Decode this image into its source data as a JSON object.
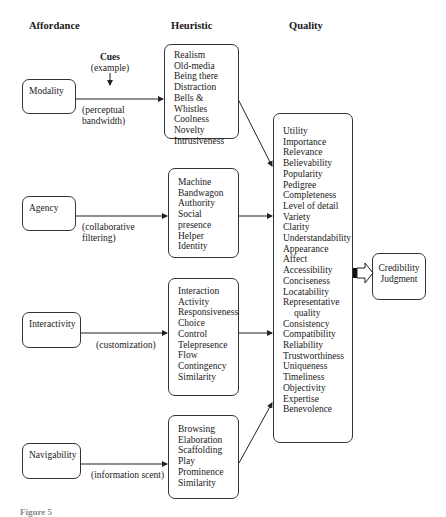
{
  "headers": {
    "affordance": "Affordance",
    "heuristic": "Heuristic",
    "quality": "Quality"
  },
  "cues": {
    "title": "Cues",
    "subtitle": "(example)"
  },
  "rows": [
    {
      "affordance": "Modality",
      "cue": [
        "(perceptual",
        "bandwidth)"
      ],
      "heuristics": [
        "Realism",
        "Old-media",
        "Being there",
        "Distraction",
        "Bells &",
        "Whistles",
        "Coolness",
        "Novelty",
        "Intrusiveness"
      ]
    },
    {
      "affordance": "Agency",
      "cue": [
        "(collaborative",
        "filtering)"
      ],
      "heuristics": [
        "Machine",
        "Bandwagon",
        "Authority",
        "Social",
        "presence",
        "Helper",
        "Identity"
      ]
    },
    {
      "affordance": "Interactivity",
      "cue": [
        "(customization)"
      ],
      "heuristics": [
        "Interaction",
        "Activity",
        "Responsiveness",
        "Choice",
        "Control",
        "Telepresence",
        "Flow",
        "Contingency",
        "Similarity"
      ]
    },
    {
      "affordance": "Navigability",
      "cue": [
        "(information scent)"
      ],
      "heuristics": [
        "Browsing",
        "Elaboration",
        "Scaffolding",
        "Play",
        "Prominence",
        "Similarity"
      ]
    }
  ],
  "quality_items": [
    "Utility",
    "Importance",
    "Relevance",
    "Believability",
    "Popularity",
    "Pedigree",
    "Completeness",
    "Level of detail",
    "Variety",
    "Clarity",
    "Understandability",
    "Appearance",
    "Affect",
    "Accessibility",
    "Conciseness",
    "Locatability",
    "Representative",
    "quality",
    "Consistency",
    "Compatibility",
    "Reliability",
    "Trustworthiness",
    "Uniqueness",
    "Timeliness",
    "Objectivity",
    "Expertise",
    "Benevolence"
  ],
  "outcome": [
    "Credibility",
    "Judgment"
  ],
  "caption": "Figure 5",
  "colors": {
    "stroke": "#333333",
    "text": "#1a1a1a",
    "background": "#ffffff"
  }
}
